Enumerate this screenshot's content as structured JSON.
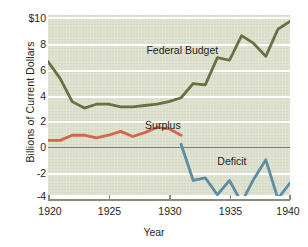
{
  "chart_data": {
    "type": "line",
    "title": "",
    "xlabel": "Year",
    "ylabel": "Billions of Current Dollars",
    "xlim": [
      1920,
      1940
    ],
    "ylim": [
      -4,
      10
    ],
    "grid": true,
    "legend_position": "inline-annotations",
    "x_ticks": [
      "1920",
      "1925",
      "1930",
      "1935",
      "1940"
    ],
    "x_tick_values": [
      1920,
      1925,
      1930,
      1935,
      1940
    ],
    "y_ticks": [
      "$10",
      "8",
      "6",
      "4",
      "2",
      "0",
      "-2",
      "-4"
    ],
    "y_tick_values": [
      10,
      8,
      6,
      4,
      2,
      0,
      -2,
      -4
    ],
    "zero_line": 0,
    "background_color": "#dde0cd",
    "gridline_color": "#ffffff",
    "series": [
      {
        "name": "Federal Budget",
        "color": "#6b7043",
        "x": [
          1920,
          1921,
          1922,
          1923,
          1924,
          1925,
          1926,
          1927,
          1928,
          1929,
          1930,
          1931,
          1932,
          1933,
          1934,
          1935,
          1936,
          1937,
          1938,
          1939,
          1940
        ],
        "values": [
          6.4,
          5.1,
          3.3,
          2.8,
          3.1,
          3.1,
          2.9,
          2.9,
          3.0,
          3.1,
          3.3,
          3.6,
          4.7,
          4.6,
          6.7,
          6.5,
          8.4,
          7.8,
          6.8,
          8.9,
          9.5
        ]
      },
      {
        "name": "Surplus",
        "color": "#d1674c",
        "x": [
          1920,
          1921,
          1922,
          1923,
          1924,
          1925,
          1926,
          1927,
          1928,
          1929,
          1930,
          1931
        ],
        "values": [
          0.3,
          0.3,
          0.7,
          0.7,
          0.5,
          0.7,
          1.0,
          0.6,
          0.9,
          1.3,
          1.2,
          0.7
        ]
      },
      {
        "name": "Deficit",
        "color": "#5f8da1",
        "x": [
          1931,
          1932,
          1933,
          1934,
          1935,
          1936,
          1937,
          1938,
          1939,
          1940
        ],
        "values": [
          0.0,
          -2.8,
          -2.6,
          -3.9,
          -2.8,
          -4.5,
          -2.7,
          -1.2,
          -4.2,
          -3.0
        ]
      }
    ],
    "annotations": [
      {
        "text": "Federal Budget",
        "x": 1931.1,
        "y": 7.3
      },
      {
        "text": "Surplus",
        "x": 1929.5,
        "y": 1.5
      },
      {
        "text": "Deficit",
        "x": 1935.2,
        "y": -1.3
      }
    ]
  }
}
